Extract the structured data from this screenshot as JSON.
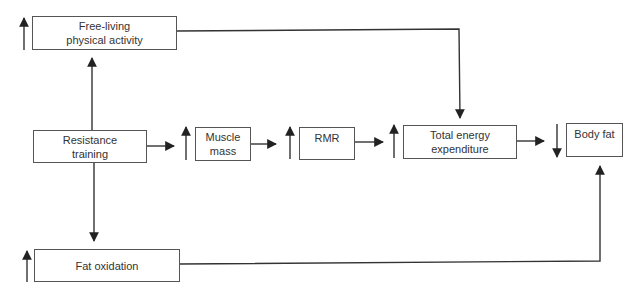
{
  "diagram": {
    "nodes": {
      "free_living": {
        "label": "Free-living\nphysical activity",
        "direction": "increase"
      },
      "resistance_training": {
        "label": "Resistance\ntraining"
      },
      "muscle_mass": {
        "label": "Muscle\nmass",
        "direction": "increase"
      },
      "rmr": {
        "label": "RMR",
        "direction": "increase"
      },
      "tee": {
        "label": "Total energy\nexpenditure",
        "direction": "increase"
      },
      "body_fat": {
        "label": "Body fat",
        "direction": "decrease"
      },
      "fat_oxidation": {
        "label": "Fat oxidation",
        "direction": "increase"
      }
    },
    "edges": [
      {
        "from": "resistance_training",
        "to": "free_living"
      },
      {
        "from": "resistance_training",
        "to": "fat_oxidation"
      },
      {
        "from": "resistance_training",
        "to": "muscle_mass"
      },
      {
        "from": "muscle_mass",
        "to": "rmr"
      },
      {
        "from": "rmr",
        "to": "tee"
      },
      {
        "from": "free_living",
        "to": "tee"
      },
      {
        "from": "tee",
        "to": "body_fat"
      },
      {
        "from": "fat_oxidation",
        "to": "body_fat"
      }
    ],
    "colors": {
      "line": "#333333",
      "box_border": "#555555",
      "text": "#333333"
    }
  }
}
